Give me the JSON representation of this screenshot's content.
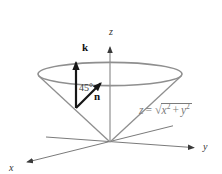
{
  "figure": {
    "background": "#ffffff",
    "colors": {
      "cone_stroke": "#8f8f8f",
      "axis_stroke": "#6b6b6b",
      "axis_arrow": "#3a3a3a",
      "vector_stroke": "#161616",
      "label_text": "#333333",
      "equation_text": "#7b7b7b",
      "angle_text": "#3d3d3d"
    },
    "axes": {
      "z_label": "z",
      "y_label": "y",
      "x_label": "x"
    },
    "vectors": {
      "k_label": "k",
      "n_label": "n"
    },
    "angle_label": "45°",
    "equation": {
      "lhs": "z",
      "equals": "=",
      "radical": "√",
      "x_var": "x",
      "x_exp": "2",
      "plus": "+",
      "y_var": "y",
      "y_exp": "2"
    }
  }
}
